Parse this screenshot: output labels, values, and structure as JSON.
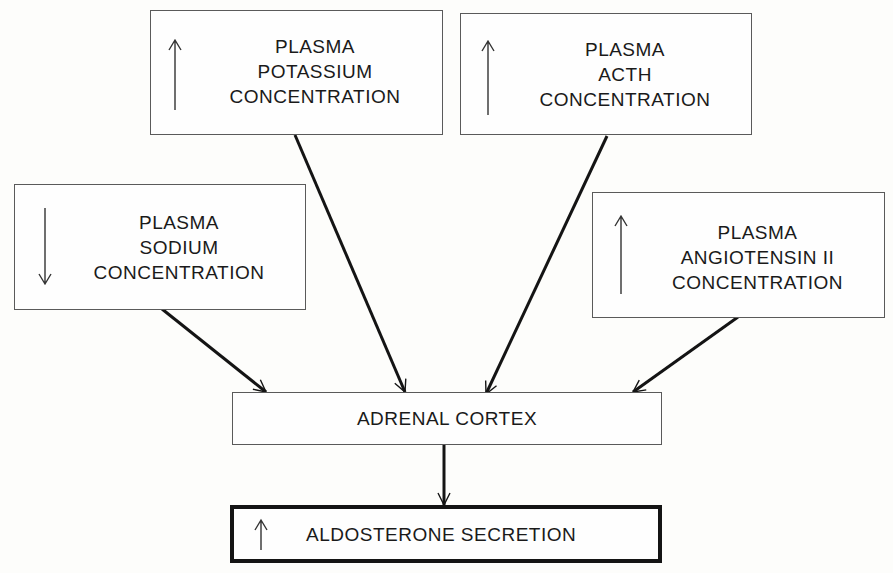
{
  "diagram": {
    "inputs": [
      {
        "id": "potassium",
        "direction": "up",
        "lines": [
          "PLASMA",
          "POTASSIUM",
          "CONCENTRATION"
        ]
      },
      {
        "id": "acth",
        "direction": "up",
        "lines": [
          "PLASMA",
          "ACTH",
          "CONCENTRATION"
        ]
      },
      {
        "id": "sodium",
        "direction": "down",
        "lines": [
          "PLASMA",
          "SODIUM",
          "CONCENTRATION"
        ]
      },
      {
        "id": "angiotensin",
        "direction": "up",
        "lines": [
          "PLASMA",
          "ANGIOTENSIN II",
          "CONCENTRATION"
        ]
      }
    ],
    "target": {
      "label": "ADRENAL CORTEX"
    },
    "output": {
      "direction": "up",
      "label": "ALDOSTERONE SECRETION"
    },
    "edges": [
      {
        "from": "sodium",
        "to": "adrenal-cortex"
      },
      {
        "from": "potassium",
        "to": "adrenal-cortex"
      },
      {
        "from": "acth",
        "to": "adrenal-cortex"
      },
      {
        "from": "angiotensin",
        "to": "adrenal-cortex"
      },
      {
        "from": "adrenal-cortex",
        "to": "aldosterone-secretion"
      }
    ],
    "colors": {
      "line": "#141414",
      "box_border": "#5a5a5a",
      "background": "#fdfdfb"
    }
  }
}
